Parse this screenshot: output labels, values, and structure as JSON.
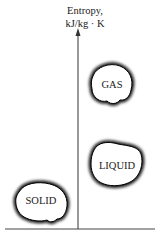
{
  "axis": {
    "y_label_line1": "Entropy,",
    "y_label_line2": "kJ/kg · K"
  },
  "phases": [
    {
      "name": "GAS"
    },
    {
      "name": "LIQUID"
    },
    {
      "name": "SOLID"
    }
  ],
  "colors": {
    "ink": "#1a1a1a",
    "background": "#ffffff"
  }
}
